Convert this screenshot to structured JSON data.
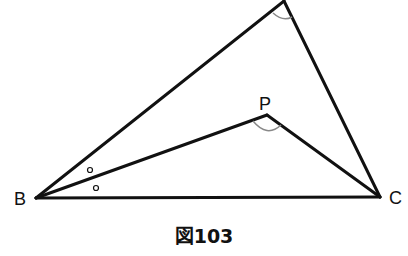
{
  "figure": {
    "caption": "図103",
    "points": {
      "A": {
        "label": "",
        "x": 284,
        "y": 1
      },
      "B": {
        "label": "B",
        "x": 36,
        "y": 198
      },
      "C": {
        "label": "C",
        "x": 380,
        "y": 197
      },
      "P": {
        "label": "P",
        "x": 267,
        "y": 115
      }
    },
    "segments": [
      "AB",
      "AC",
      "BC",
      "BP",
      "PC"
    ],
    "angle_marks": [
      {
        "vertex": "A",
        "type": "arc"
      },
      {
        "vertex": "P",
        "type": "arc"
      },
      {
        "vertex": "B",
        "type": "circle",
        "between": "BA-BP"
      },
      {
        "vertex": "B",
        "type": "circle",
        "between": "BP-BC"
      }
    ],
    "colors": {
      "line": "#111111",
      "arc": "#888888"
    }
  }
}
